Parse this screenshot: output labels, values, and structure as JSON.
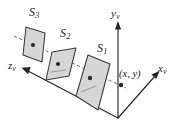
{
  "figure": {
    "background_color": "#ffffff",
    "ink_color": "#262626",
    "surface_fill_color": "#d6d6d6",
    "surface_stroke_color": "#3a3a3a",
    "ray_color": "#6b6b6b"
  },
  "axes": [
    {
      "id": "y-axis",
      "label_base": "y",
      "label_subscript": "v",
      "label_full": "yv",
      "direction": "up",
      "origin": [
        118,
        118
      ],
      "tip": [
        118,
        22
      ]
    },
    {
      "id": "x-axis",
      "label_base": "x",
      "label_subscript": "v",
      "label_full": "xv",
      "direction": "up-right",
      "origin": [
        118,
        118
      ],
      "tip": [
        159,
        72
      ]
    },
    {
      "id": "z-axis",
      "label_base": "z",
      "label_subscript": "v",
      "label_full": "zv",
      "direction": "up-left",
      "origin": [
        118,
        118
      ],
      "tip": [
        22,
        68
      ]
    }
  ],
  "surfaces": [
    {
      "id": "surface-1",
      "label_base": "S",
      "label_subscript": "1",
      "label_full": "S1",
      "pierce_point": [
        88,
        84
      ],
      "description": "nearest quadrilateral surface"
    },
    {
      "id": "surface-2",
      "label_base": "S",
      "label_subscript": "2",
      "label_full": "S2",
      "pierce_point": [
        57,
        66
      ],
      "description": "middle quadrilateral surface"
    },
    {
      "id": "surface-3",
      "label_base": "S",
      "label_subscript": "3",
      "label_full": "S3",
      "pierce_point": [
        33,
        45
      ],
      "description": "farthest quadrilateral surface"
    }
  ],
  "point": {
    "id": "projection-point",
    "label": "(x, y)",
    "position": [
      121,
      84
    ]
  }
}
